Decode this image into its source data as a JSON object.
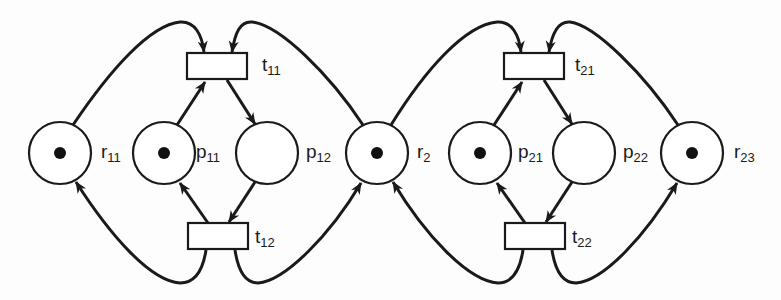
{
  "diagram": {
    "type": "petri-net",
    "colors": {
      "stroke": "#1a1a1a",
      "fill": "#ffffff",
      "token": "#111111"
    },
    "places": [
      {
        "id": "r11",
        "label": "r",
        "subscript": "11",
        "tokens": 1
      },
      {
        "id": "p11",
        "label": "p",
        "subscript": "11",
        "tokens": 1
      },
      {
        "id": "p12",
        "label": "p",
        "subscript": "12",
        "tokens": 0
      },
      {
        "id": "r2",
        "label": "r",
        "subscript": "2",
        "tokens": 1
      },
      {
        "id": "p21",
        "label": "p",
        "subscript": "21",
        "tokens": 1
      },
      {
        "id": "p22",
        "label": "p",
        "subscript": "22",
        "tokens": 0
      },
      {
        "id": "r23",
        "label": "r",
        "subscript": "23",
        "tokens": 1
      }
    ],
    "transitions": [
      {
        "id": "t11",
        "label": "t",
        "subscript": "11"
      },
      {
        "id": "t12",
        "label": "t",
        "subscript": "12"
      },
      {
        "id": "t21",
        "label": "t",
        "subscript": "21"
      },
      {
        "id": "t22",
        "label": "t",
        "subscript": "22"
      }
    ],
    "arcs": [
      {
        "from": "r11",
        "to": "t11"
      },
      {
        "from": "p11",
        "to": "t11"
      },
      {
        "from": "r2",
        "to": "t11"
      },
      {
        "from": "t11",
        "to": "p12"
      },
      {
        "from": "p12",
        "to": "t12"
      },
      {
        "from": "t12",
        "to": "p11"
      },
      {
        "from": "t12",
        "to": "r11"
      },
      {
        "from": "t12",
        "to": "r2"
      },
      {
        "from": "r2",
        "to": "t21"
      },
      {
        "from": "p21",
        "to": "t21"
      },
      {
        "from": "r23",
        "to": "t21"
      },
      {
        "from": "t21",
        "to": "p22"
      },
      {
        "from": "p22",
        "to": "t22"
      },
      {
        "from": "t22",
        "to": "p21"
      },
      {
        "from": "t22",
        "to": "r2"
      },
      {
        "from": "t22",
        "to": "r23"
      }
    ]
  }
}
